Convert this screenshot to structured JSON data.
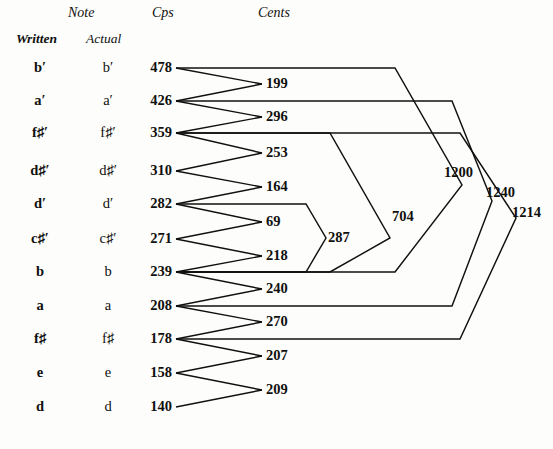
{
  "figure": {
    "headers": {
      "note_group": "Note",
      "written": "Written",
      "actual": "Actual",
      "cps": "Cps",
      "cents": "Cents"
    },
    "rows": [
      {
        "written": "b′",
        "actual": "b′",
        "cps": "478"
      },
      {
        "written": "a′",
        "actual": "a′",
        "cps": "426"
      },
      {
        "written": "f♯′",
        "actual": "f♯′",
        "cps": "359"
      },
      {
        "written": "d♯′",
        "actual": "d♯′",
        "cps": "310"
      },
      {
        "written": "d′",
        "actual": "d′",
        "cps": "282"
      },
      {
        "written": "c♯′",
        "actual": "c♯′",
        "cps": "271"
      },
      {
        "written": "b",
        "actual": "b",
        "cps": "239"
      },
      {
        "written": "a",
        "actual": "a",
        "cps": "208"
      },
      {
        "written": "f♯",
        "actual": "f♯",
        "cps": "178"
      },
      {
        "written": "e",
        "actual": "e",
        "cps": "158"
      },
      {
        "written": "d",
        "actual": "d",
        "cps": "140"
      }
    ],
    "interval_cents": [
      {
        "value": "199",
        "between": [
          "478",
          "426"
        ]
      },
      {
        "value": "296",
        "between": [
          "426",
          "359"
        ]
      },
      {
        "value": "253",
        "between": [
          "359",
          "310"
        ]
      },
      {
        "value": "164",
        "between": [
          "310",
          "282"
        ]
      },
      {
        "value": "69",
        "between": [
          "282",
          "271"
        ]
      },
      {
        "value": "218",
        "between": [
          "271",
          "239"
        ]
      },
      {
        "value": "240",
        "between": [
          "239",
          "208"
        ]
      },
      {
        "value": "270",
        "between": [
          "208",
          "178"
        ]
      },
      {
        "value": "207",
        "between": [
          "178",
          "158"
        ]
      },
      {
        "value": "209",
        "between": [
          "158",
          "140"
        ]
      }
    ],
    "span_cents": [
      {
        "value": "287",
        "between": [
          "282",
          "239"
        ]
      },
      {
        "value": "704",
        "between": [
          "359",
          "239"
        ]
      },
      {
        "value": "1200",
        "between": [
          "478",
          "239"
        ]
      },
      {
        "value": "1240",
        "between": [
          "426",
          "208"
        ]
      },
      {
        "value": "1214",
        "between": [
          "359",
          "178"
        ]
      }
    ]
  },
  "colors": {
    "ink": "#10100e",
    "paper": "#fdfdfb"
  }
}
